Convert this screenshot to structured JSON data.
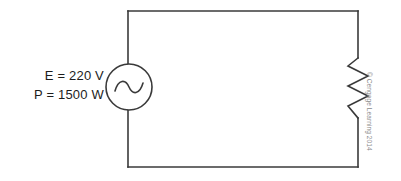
{
  "figure": {
    "type": "ac-circuit-schematic",
    "background_color": "#ffffff",
    "line_color": "#3a3a3a",
    "text_color": "#1c1c1c"
  },
  "labels": {
    "voltage": "E = 220 V",
    "power": "P = 1500 W"
  },
  "components": {
    "source": {
      "name": "ac-voltage-source",
      "symbol": "circle-with-sine-wave",
      "center_x": 129,
      "center_y": 87,
      "radius": 23
    },
    "load": {
      "name": "resistor",
      "symbol": "zigzag",
      "axis_x": 358,
      "top_y": 58,
      "bottom_y": 118
    },
    "wires": {
      "left_x": 128,
      "right_x": 358,
      "top_y": 11,
      "bottom_y": 167
    }
  },
  "credit": {
    "text": "© Cengage Learning 2014",
    "color": "#8a8a8a"
  }
}
